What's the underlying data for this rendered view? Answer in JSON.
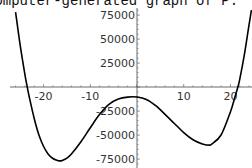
{
  "title": "computer-generated graph of P.",
  "chart_data": {
    "type": "line",
    "title": "computer-generated graph of P.",
    "xlabel": "",
    "ylabel": "",
    "x_ticks": [
      -20,
      -10,
      10,
      20
    ],
    "x_tick_labels": [
      "-20",
      "-10",
      "10",
      "20"
    ],
    "y_ticks": [
      75000,
      50000,
      25000,
      -25000,
      -50000,
      -75000
    ],
    "y_tick_labels": [
      "75000",
      "50000",
      "25000",
      "-25000",
      "-50000",
      "-75000"
    ],
    "xlim": [
      -25,
      24
    ],
    "ylim": [
      -80000,
      80000
    ],
    "grid": false,
    "series": [
      {
        "name": "P",
        "x": [
          -26,
          -25,
          -24,
          -23.5,
          -23,
          -22,
          -21,
          -20,
          -19,
          -18,
          -17,
          -16.5,
          -16,
          -15,
          -14,
          -12,
          -10,
          -8,
          -6,
          -4,
          -2,
          0,
          2,
          4,
          6,
          8,
          10,
          12,
          14,
          15,
          15.4,
          16,
          18,
          20,
          21,
          21.6,
          22,
          23,
          24,
          24.5
        ],
        "y": [
          78000,
          43000,
          13000,
          0,
          -12000,
          -33000,
          -50000,
          -62000,
          -70000,
          -74500,
          -76500,
          -77000,
          -76500,
          -74000,
          -69500,
          -57000,
          -42500,
          -28500,
          -18000,
          -12500,
          -10500,
          -10500,
          -13000,
          -19500,
          -28500,
          -38000,
          -47500,
          -55000,
          -59500,
          -60500,
          -60500,
          -59500,
          -50000,
          -26000,
          -10000,
          0,
          8000,
          34000,
          65000,
          80000
        ]
      }
    ]
  }
}
